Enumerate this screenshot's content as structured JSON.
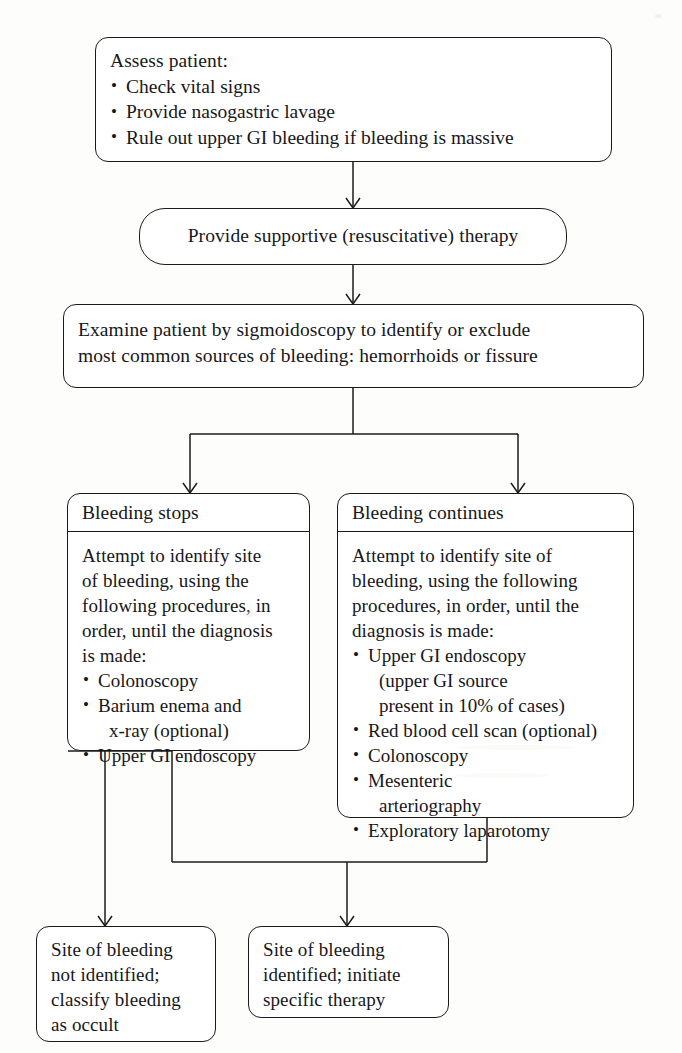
{
  "diagram": {
    "ink_color": "#1b1b1e",
    "paper_color": "#fdfdfc"
  },
  "nodes": {
    "assess": {
      "heading": "Assess patient:",
      "bullets": [
        "Check vital signs",
        "Provide nasogastric lavage",
        "Rule out upper GI bleeding if bleeding is massive"
      ]
    },
    "supportive": {
      "text": "Provide supportive (resuscitative) therapy"
    },
    "examine": {
      "lines": [
        "Examine patient by sigmoidoscopy to identify or exclude",
        "most common sources of bleeding: hemorrhoids or fissure"
      ]
    },
    "stops": {
      "header": "Bleeding stops",
      "lines": [
        "Attempt to identify site",
        "of bleeding, using the",
        "following procedures, in",
        "order, until the diagnosis",
        "is made:"
      ],
      "items": [
        {
          "bullet": "Colonoscopy",
          "cont": []
        },
        {
          "bullet": "Barium enema and",
          "cont": [
            "x-ray (optional)"
          ]
        },
        {
          "bullet": "Upper GI endoscopy",
          "cont": []
        }
      ]
    },
    "continues": {
      "header": "Bleeding continues",
      "lines": [
        "Attempt to identify site of",
        "bleeding, using the following",
        "procedures, in order, until the",
        "diagnosis is made:"
      ],
      "items": [
        {
          "bullet": "Upper GI endoscopy",
          "cont": [
            "(upper GI source",
            "present in 10% of cases)"
          ]
        },
        {
          "bullet": "Red blood cell scan (optional)",
          "cont": []
        },
        {
          "bullet": "Colonoscopy",
          "cont": []
        },
        {
          "bullet": "Mesenteric",
          "cont": [
            "arteriography"
          ]
        },
        {
          "bullet": "Exploratory laparotomy",
          "cont": []
        }
      ]
    },
    "occult": {
      "lines": [
        "Site of bleeding",
        "not identified;",
        "classify bleeding",
        "as occult"
      ]
    },
    "identified": {
      "lines": [
        "Site of bleeding",
        "identified; initiate",
        "specific therapy"
      ]
    }
  }
}
